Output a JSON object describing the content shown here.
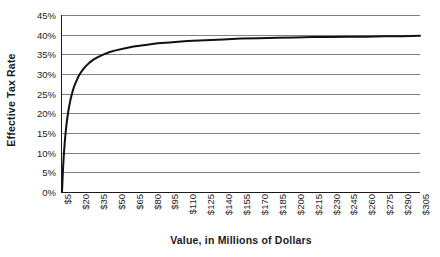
{
  "chart_data": {
    "type": "line",
    "title": "",
    "xlabel": "Value, in Millions of Dollars",
    "ylabel": "Effective Tax Rate",
    "xlim": [
      5,
      305
    ],
    "ylim": [
      0,
      45
    ],
    "grid": true,
    "legend": "none",
    "line_color": "#111111",
    "grid_color": "#808080",
    "axis_color": "#1a1a1a",
    "x_tick_labels": [
      "$5",
      "$20",
      "$35",
      "$50",
      "$65",
      "$80",
      "$95",
      "$110",
      "$125",
      "$140",
      "$155",
      "$170",
      "$185",
      "$200",
      "$215",
      "$230",
      "$245",
      "$260",
      "$275",
      "$290",
      "$305"
    ],
    "x_tick_values": [
      5,
      20,
      35,
      50,
      65,
      80,
      95,
      110,
      125,
      140,
      155,
      170,
      185,
      200,
      215,
      230,
      245,
      260,
      275,
      290,
      305
    ],
    "y_tick_labels": [
      "0%",
      "5%",
      "10%",
      "15%",
      "20%",
      "25%",
      "30%",
      "35%",
      "40%",
      "45%"
    ],
    "y_tick_values": [
      0,
      5,
      10,
      15,
      20,
      25,
      30,
      35,
      40,
      45
    ],
    "series": [
      {
        "name": "Effective Tax Rate",
        "x": [
          5,
          5.5,
          6,
          6.5,
          7,
          7.5,
          8,
          9,
          10,
          11,
          12,
          13,
          14,
          15,
          17,
          19,
          21,
          23,
          25,
          28,
          31,
          35,
          40,
          45,
          50,
          57,
          65,
          75,
          85,
          95,
          110,
          125,
          140,
          155,
          170,
          185,
          200,
          215,
          230,
          245,
          260,
          275,
          290,
          305
        ],
        "y": [
          0,
          3.6,
          6.7,
          9.2,
          11.4,
          13.3,
          15.0,
          17.8,
          20.0,
          21.8,
          23.3,
          24.6,
          25.7,
          26.7,
          28.2,
          29.5,
          30.5,
          31.3,
          32.0,
          32.9,
          33.6,
          34.3,
          35.0,
          35.6,
          36.0,
          36.5,
          37.0,
          37.4,
          37.8,
          38.0,
          38.4,
          38.6,
          38.8,
          39.0,
          39.1,
          39.2,
          39.3,
          39.4,
          39.4,
          39.5,
          39.5,
          39.6,
          39.6,
          39.7
        ]
      }
    ],
    "annotation": "Curve rises steeply from 0% at $5M and asymptotes toward 40%."
  }
}
